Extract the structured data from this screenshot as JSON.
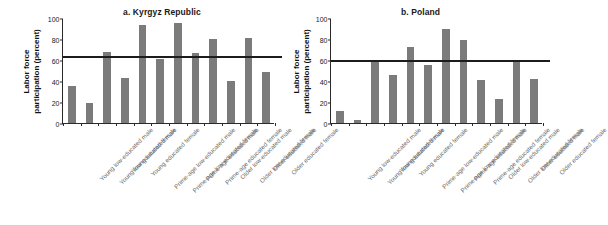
{
  "figure": {
    "ylabel_line1": "Labor force",
    "ylabel_line2": "participation (percent)"
  },
  "chart_data": [
    {
      "type": "bar",
      "title": "a. Kyrgyz Republic",
      "xlabel": "",
      "ylabel": "Labor force participation (percent)",
      "ylim": [
        0,
        100
      ],
      "yticks": [
        0,
        20,
        40,
        60,
        80,
        100
      ],
      "ytick_labels": [
        "0",
        "20",
        "40",
        "60",
        "80",
        "100"
      ],
      "grid": false,
      "legend": "none",
      "bar_color": "#7b7b7b",
      "reference_line": {
        "label": "National average",
        "value": 64,
        "color": "#1c1c1c"
      },
      "categories": [
        "Young low-educated male",
        "Young low-educated female",
        "Young educated male",
        "Young educated female",
        "Prime-age low-educated male",
        "Prime-age low-educated female",
        "Prime-age educated male",
        "Prime-age educated female",
        "Older low-educated male",
        "Older low-educated female",
        "Older educated male",
        "Older educated female"
      ],
      "values": [
        35,
        19,
        68,
        43,
        93,
        61,
        95,
        67,
        80,
        40,
        81,
        49
      ]
    },
    {
      "type": "bar",
      "title": "b. Poland",
      "xlabel": "",
      "ylabel": "Labor force participation (percent)",
      "ylim": [
        0,
        100
      ],
      "yticks": [
        0,
        20,
        40,
        60,
        80,
        100
      ],
      "ytick_labels": [
        "0",
        "20",
        "40",
        "60",
        "80",
        "100"
      ],
      "grid": false,
      "legend": "none",
      "bar_color": "#7b7b7b",
      "reference_line": {
        "label": "National average",
        "value": 60,
        "color": "#1c1c1c"
      },
      "categories": [
        "Young low-educated male",
        "Young low-educated female",
        "Young educated male",
        "Young educated female",
        "Prime-age low-educated male",
        "Prime-age low-educated female",
        "Prime-age educated male",
        "Prime-age educated female",
        "Older low-educated male",
        "Older low-educated female",
        "Older educated male",
        "Older educated female"
      ],
      "values": [
        11,
        3,
        60,
        46,
        72,
        55,
        90,
        79,
        41,
        23,
        60,
        42
      ]
    }
  ]
}
